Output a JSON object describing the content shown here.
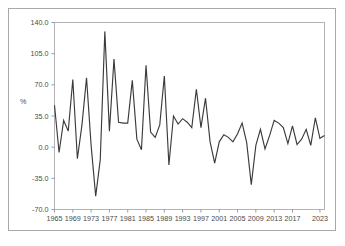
{
  "figure": {
    "background_color": "#ffffff",
    "frame_color": "#a9a9ad",
    "plot_border_color": "#b3b3b7",
    "line_color": "#3b3b3f",
    "tick_label_color": "#4a4a4a"
  },
  "axis": {
    "y_label": "%",
    "y_ticks": [
      "140.0",
      "105.0",
      "70.0",
      "35.0",
      "0.0",
      "-35.0",
      "-70.0"
    ],
    "x_ticks": [
      "1965",
      "1969",
      "1973",
      "1977",
      "1981",
      "1985",
      "1989",
      "1993",
      "1997",
      "2001",
      "2005",
      "2009",
      "2013",
      "2017",
      "2023"
    ]
  },
  "chart_data": {
    "type": "line",
    "title": "",
    "xlabel": "",
    "ylabel": "%",
    "ylim": [
      -70,
      140
    ],
    "xlim": [
      1965,
      2024
    ],
    "grid": false,
    "legend": "none",
    "x": [
      1965,
      1966,
      1967,
      1968,
      1969,
      1970,
      1971,
      1972,
      1973,
      1974,
      1975,
      1976,
      1977,
      1978,
      1979,
      1980,
      1981,
      1982,
      1983,
      1984,
      1985,
      1986,
      1987,
      1988,
      1989,
      1990,
      1991,
      1992,
      1993,
      1994,
      1995,
      1996,
      1997,
      1998,
      1999,
      2000,
      2001,
      2002,
      2003,
      2004,
      2005,
      2006,
      2007,
      2008,
      2009,
      2010,
      2011,
      2012,
      2013,
      2014,
      2015,
      2016,
      2017,
      2018,
      2019,
      2020,
      2021,
      2022,
      2023,
      2024
    ],
    "series": [
      {
        "name": "annual change",
        "values": [
          47,
          -6,
          30,
          18,
          76,
          -13,
          25,
          78,
          2,
          -55,
          -14,
          130,
          18,
          99,
          28,
          27,
          27,
          75,
          9,
          -3,
          92,
          17,
          11,
          25,
          80,
          -20,
          35,
          26,
          32,
          28,
          22,
          65,
          22,
          55,
          6,
          -18,
          6,
          14,
          11,
          6,
          15,
          27,
          5,
          -42,
          2,
          20,
          -2,
          13,
          30,
          27,
          22,
          4,
          24,
          3,
          9,
          20,
          2,
          33,
          10,
          13
        ]
      }
    ]
  }
}
